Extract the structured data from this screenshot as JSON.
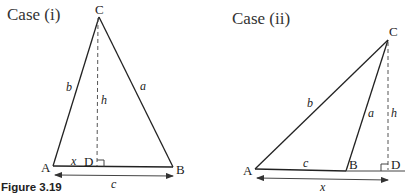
{
  "figure": {
    "caption": "Figure 3.19",
    "cases": [
      {
        "title": "Case (i)",
        "vertices": {
          "A": "A",
          "B": "B",
          "C": "C",
          "D": "D"
        },
        "sides": {
          "a": "a",
          "b": "b",
          "c": "c",
          "h": "h",
          "x": "x"
        }
      },
      {
        "title": "Case (ii)",
        "vertices": {
          "A": "A",
          "B": "B",
          "C": "C",
          "D": "D"
        },
        "sides": {
          "a": "a",
          "b": "b",
          "c": "c",
          "h": "h",
          "x": "x"
        }
      }
    ]
  }
}
